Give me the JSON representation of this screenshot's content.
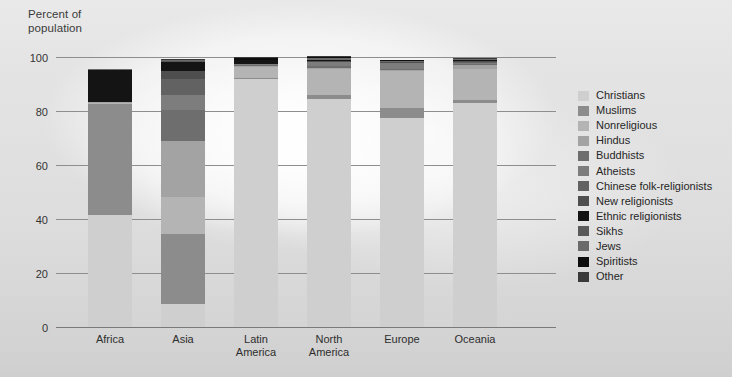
{
  "axis": {
    "y_title_line1": "Percent of",
    "y_title_line2": "population",
    "yticks": [
      "100",
      "80",
      "60",
      "40",
      "20",
      "0"
    ]
  },
  "legend": {
    "position": "right",
    "items": [
      {
        "label": "Christians",
        "color": "#cfcfcf"
      },
      {
        "label": "Muslims",
        "color": "#8c8c8c"
      },
      {
        "label": "Nonreligious",
        "color": "#b4b4b4"
      },
      {
        "label": "Hindus",
        "color": "#a3a3a3"
      },
      {
        "label": "Buddhists",
        "color": "#6e6e6e"
      },
      {
        "label": "Atheists",
        "color": "#7d7d7d"
      },
      {
        "label": "Chinese folk-religionists",
        "color": "#626262"
      },
      {
        "label": "New religionists",
        "color": "#4e4e4e"
      },
      {
        "label": "Ethnic religionists",
        "color": "#141414"
      },
      {
        "label": "Sikhs",
        "color": "#5a5a5a"
      },
      {
        "label": "Jews",
        "color": "#6a6a6a"
      },
      {
        "label": "Spiritists",
        "color": "#0d0d0d"
      },
      {
        "label": "Other",
        "color": "#3a3a3a"
      }
    ]
  },
  "chart_data": {
    "type": "bar",
    "subtype": "stacked-column",
    "title": "",
    "xlabel": "",
    "ylabel": "Percent of population",
    "ylim": [
      0,
      100
    ],
    "yticks": [
      0,
      20,
      40,
      60,
      80,
      100
    ],
    "grid": true,
    "categories": [
      "Africa",
      "Asia",
      "Latin America",
      "North America",
      "Europe",
      "Oceania"
    ],
    "category_labels": [
      [
        "Africa"
      ],
      [
        "Asia"
      ],
      [
        "Latin",
        "America"
      ],
      [
        "North",
        "America"
      ],
      [
        "Europe"
      ],
      [
        "Oceania"
      ]
    ],
    "series": [
      {
        "name": "Christians",
        "color": "#cfcfcf",
        "values": [
          41.5,
          8.5,
          92.0,
          84.5,
          77.5,
          83.0
        ]
      },
      {
        "name": "Muslims",
        "color": "#8c8c8c",
        "values": [
          41.0,
          26.0,
          0.4,
          1.5,
          3.5,
          1.2
        ]
      },
      {
        "name": "Nonreligious",
        "color": "#b4b4b4",
        "values": [
          0.5,
          13.5,
          4.0,
          9.5,
          14.0,
          11.5
        ]
      },
      {
        "name": "Hindus",
        "color": "#a3a3a3",
        "values": [
          0.2,
          21.0,
          0.3,
          0.5,
          0.3,
          1.3
        ]
      },
      {
        "name": "Buddhists",
        "color": "#6e6e6e",
        "values": [
          0.0,
          11.5,
          0.2,
          0.6,
          0.2,
          0.4
        ]
      },
      {
        "name": "Atheists",
        "color": "#7d7d7d",
        "values": [
          0.3,
          5.5,
          0.4,
          1.4,
          2.3,
          0.5
        ]
      },
      {
        "name": "Chinese folk-religionists",
        "color": "#626262",
        "values": [
          0.0,
          6.0,
          0.1,
          0.2,
          0.1,
          0.3
        ]
      },
      {
        "name": "New religionists",
        "color": "#4e4e4e",
        "values": [
          0.0,
          3.0,
          0.1,
          0.2,
          0.1,
          0.2
        ]
      },
      {
        "name": "Ethnic religionists",
        "color": "#141414",
        "values": [
          11.8,
          3.0,
          1.3,
          0.4,
          0.2,
          0.6
        ]
      },
      {
        "name": "Sikhs",
        "color": "#5a5a5a",
        "values": [
          0.0,
          0.6,
          0.0,
          0.2,
          0.1,
          0.1
        ]
      },
      {
        "name": "Jews",
        "color": "#6a6a6a",
        "values": [
          0.1,
          0.2,
          0.3,
          0.8,
          0.4,
          0.3
        ]
      },
      {
        "name": "Spiritists",
        "color": "#0d0d0d",
        "values": [
          0.0,
          0.1,
          0.6,
          0.1,
          0.1,
          0.0
        ]
      },
      {
        "name": "Other",
        "color": "#3a3a3a",
        "values": [
          0.1,
          0.5,
          0.3,
          0.4,
          0.3,
          0.3
        ]
      }
    ],
    "totals": [
      95.5,
      99.4,
      100.0,
      100.3,
      99.1,
      99.7
    ],
    "visible_stack_tops_percent": [
      54.0,
      92.0,
      7.5,
      14.5,
      21.5,
      15.5
    ]
  }
}
